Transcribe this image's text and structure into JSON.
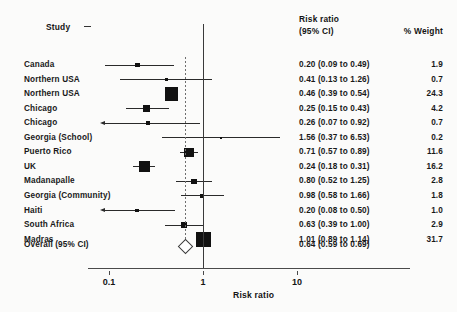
{
  "headers": {
    "study": "Study",
    "risk_ratio_line1": "Risk ratio",
    "risk_ratio_line2": "(95% CI)",
    "weight": "% Weight"
  },
  "axis": {
    "title": "Risk ratio",
    "ticks": [
      "0.1",
      "1",
      "10"
    ],
    "tick_values": [
      0.1,
      1,
      10
    ],
    "scale": "log10",
    "null_value": 1
  },
  "overall": {
    "label": "Overall (95% CI)",
    "text": "0.64 (0.59 to 0.69)",
    "estimate": 0.64,
    "lower": 0.59,
    "upper": 0.69,
    "weight": ""
  },
  "colors": {
    "marker": "#111111",
    "ci_line": "#2a2a2a",
    "null_line": "#3a3a3a",
    "overall_line": "#6e6e6e",
    "text": "#191919",
    "background": "#fbfbfa"
  },
  "chart_data": {
    "type": "forest",
    "title": "",
    "xlabel": "Risk ratio",
    "ylabel": "Study",
    "xscale": "log",
    "xlim": [
      0.07,
      10
    ],
    "xticks": [
      0.1,
      1,
      10
    ],
    "xticklabels": [
      "0.1",
      "1",
      "10"
    ],
    "null_line": 1,
    "effect_measure": "Risk ratio",
    "ci_level": "95% CI",
    "columns": [
      "Study",
      "Risk ratio (95% CI)",
      "% Weight"
    ],
    "studies": [
      {
        "study": "Canada",
        "rr": 0.2,
        "lower": 0.09,
        "upper": 0.49,
        "weight": 1.9,
        "rr_text": "0.20 (0.09 to 0.49)",
        "weight_text": "1.9",
        "arrow_left": false,
        "arrow_right": false
      },
      {
        "study": "Northern USA",
        "rr": 0.41,
        "lower": 0.13,
        "upper": 1.26,
        "weight": 0.7,
        "rr_text": "0.41 (0.13 to 1.26)",
        "weight_text": "0.7",
        "arrow_left": false,
        "arrow_right": false
      },
      {
        "study": "Northern USA",
        "rr": 0.46,
        "lower": 0.39,
        "upper": 0.54,
        "weight": 24.3,
        "rr_text": "0.46 (0.39 to 0.54)",
        "weight_text": "24.3",
        "arrow_left": false,
        "arrow_right": false
      },
      {
        "study": "Chicago",
        "rr": 0.25,
        "lower": 0.15,
        "upper": 0.43,
        "weight": 4.2,
        "rr_text": "0.25 (0.15 to 0.43)",
        "weight_text": "4.2",
        "arrow_left": false,
        "arrow_right": false
      },
      {
        "study": "Chicago",
        "rr": 0.26,
        "lower": 0.07,
        "upper": 0.92,
        "weight": 0.7,
        "rr_text": "0.26 (0.07 to 0.92)",
        "weight_text": "0.7",
        "arrow_left": true,
        "arrow_right": false
      },
      {
        "study": "Georgia (School)",
        "rr": 1.56,
        "lower": 0.37,
        "upper": 6.53,
        "weight": 0.2,
        "rr_text": "1.56 (0.37 to 6.53)",
        "weight_text": "0.2",
        "arrow_left": false,
        "arrow_right": false
      },
      {
        "study": "Puerto Rico",
        "rr": 0.71,
        "lower": 0.57,
        "upper": 0.89,
        "weight": 11.6,
        "rr_text": "0.71 (0.57 to 0.89)",
        "weight_text": "11.6",
        "arrow_left": false,
        "arrow_right": false
      },
      {
        "study": "UK",
        "rr": 0.24,
        "lower": 0.18,
        "upper": 0.31,
        "weight": 16.2,
        "rr_text": "0.24 (0.18 to 0.31)",
        "weight_text": "16.2",
        "arrow_left": false,
        "arrow_right": false
      },
      {
        "study": "Madanapalle",
        "rr": 0.8,
        "lower": 0.52,
        "upper": 1.25,
        "weight": 2.8,
        "rr_text": "0.80 (0.52 to 1.25)",
        "weight_text": "2.8",
        "arrow_left": false,
        "arrow_right": false
      },
      {
        "study": "Georgia (Community)",
        "rr": 0.98,
        "lower": 0.58,
        "upper": 1.66,
        "weight": 1.8,
        "rr_text": "0.98 (0.58 to 1.66)",
        "weight_text": "1.8",
        "arrow_left": false,
        "arrow_right": false
      },
      {
        "study": "Haiti",
        "rr": 0.2,
        "lower": 0.08,
        "upper": 0.5,
        "weight": 1.0,
        "rr_text": "0.20 (0.08 to 0.50)",
        "weight_text": "1.0",
        "arrow_left": false,
        "arrow_right": false
      },
      {
        "study": "South Africa",
        "rr": 0.63,
        "lower": 0.39,
        "upper": 1.0,
        "weight": 2.9,
        "rr_text": "0.63 (0.39 to 1.00)",
        "weight_text": "2.9",
        "arrow_left": false,
        "arrow_right": false
      },
      {
        "study": "Madras",
        "rr": 1.01,
        "lower": 0.89,
        "upper": 1.14,
        "weight": 31.7,
        "rr_text": "1.01 (0.89 to 1.14)",
        "weight_text": "31.7",
        "arrow_left": false,
        "arrow_right": false
      }
    ],
    "summary": {
      "label": "Overall (95% CI)",
      "rr": 0.64,
      "lower": 0.59,
      "upper": 0.69,
      "rr_text": "0.64 (0.59 to 0.69)"
    }
  }
}
